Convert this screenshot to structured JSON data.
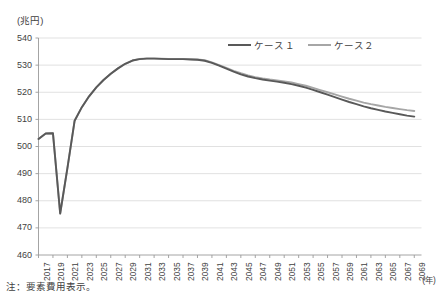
{
  "figure": {
    "unit_label": "(兆円)",
    "note": "注：要素費用表示。",
    "xaxis_unit": "(年)"
  },
  "legend": {
    "items": [
      {
        "label": "ケース１",
        "color": "#595959",
        "name": "case-1"
      },
      {
        "label": "ケース２",
        "color": "#a6a6a6",
        "name": "case-2"
      }
    ]
  },
  "chart_data": {
    "type": "line",
    "title": "",
    "xlabel": "(年)",
    "ylabel": "(兆円)",
    "ylim": [
      460,
      540
    ],
    "xlim": [
      2017,
      2070
    ],
    "grid": true,
    "legend_position": "top-right",
    "ytick_labels": [
      "540",
      "530",
      "520",
      "510",
      "500",
      "490",
      "480",
      "470",
      "460"
    ],
    "ytick_values": [
      540,
      530,
      520,
      510,
      500,
      490,
      480,
      470,
      460
    ],
    "xtick_labels": [
      "2017",
      "2019",
      "2021",
      "2023",
      "2025",
      "2027",
      "2029",
      "2031",
      "2033",
      "2035",
      "2037",
      "2039",
      "2041",
      "2043",
      "2045",
      "2047",
      "2049",
      "2051",
      "2053",
      "2055",
      "2057",
      "2059",
      "2061",
      "2063",
      "2065",
      "2067",
      "2069"
    ],
    "xtick_values": [
      2017,
      2019,
      2021,
      2023,
      2025,
      2027,
      2029,
      2031,
      2033,
      2035,
      2037,
      2039,
      2041,
      2043,
      2045,
      2047,
      2049,
      2051,
      2053,
      2055,
      2057,
      2059,
      2061,
      2063,
      2065,
      2067,
      2069
    ],
    "x": [
      2017,
      2018,
      2019,
      2020,
      2021,
      2022,
      2023,
      2024,
      2025,
      2026,
      2027,
      2028,
      2029,
      2030,
      2031,
      2032,
      2033,
      2034,
      2035,
      2036,
      2037,
      2038,
      2039,
      2040,
      2041,
      2042,
      2043,
      2044,
      2045,
      2046,
      2047,
      2048,
      2049,
      2050,
      2051,
      2052,
      2053,
      2054,
      2055,
      2056,
      2057,
      2058,
      2059,
      2060,
      2061,
      2062,
      2063,
      2064,
      2065,
      2066,
      2067,
      2068,
      2069
    ],
    "series": [
      {
        "name": "ケース１",
        "color": "#595959",
        "values": [
          502.8,
          504.8,
          504.9,
          475.3,
          492.0,
          509.5,
          514.5,
          518.5,
          521.8,
          524.5,
          526.8,
          528.8,
          530.5,
          531.7,
          532.2,
          532.4,
          532.4,
          532.3,
          532.2,
          532.2,
          532.2,
          532.1,
          532.0,
          531.6,
          530.8,
          529.8,
          528.7,
          527.6,
          526.6,
          525.8,
          525.2,
          524.7,
          524.3,
          523.9,
          523.5,
          523.0,
          522.4,
          521.7,
          520.9,
          520.0,
          519.1,
          518.2,
          517.3,
          516.4,
          515.6,
          514.8,
          514.1,
          513.5,
          512.9,
          512.4,
          511.9,
          511.4,
          511.0
        ]
      },
      {
        "name": "ケース２",
        "color": "#a6a6a6",
        "values": [
          502.8,
          504.8,
          504.9,
          475.3,
          492.0,
          509.5,
          514.5,
          518.5,
          521.8,
          524.5,
          526.8,
          528.8,
          530.5,
          531.7,
          532.3,
          532.5,
          532.5,
          532.4,
          532.3,
          532.3,
          532.3,
          532.2,
          532.1,
          531.8,
          531.0,
          530.0,
          529.0,
          527.9,
          527.0,
          526.2,
          525.6,
          525.1,
          524.7,
          524.4,
          524.0,
          523.6,
          523.0,
          522.4,
          521.6,
          520.8,
          520.0,
          519.2,
          518.4,
          517.6,
          516.9,
          516.2,
          515.6,
          515.1,
          514.6,
          514.2,
          513.8,
          513.4,
          513.1
        ]
      }
    ]
  }
}
